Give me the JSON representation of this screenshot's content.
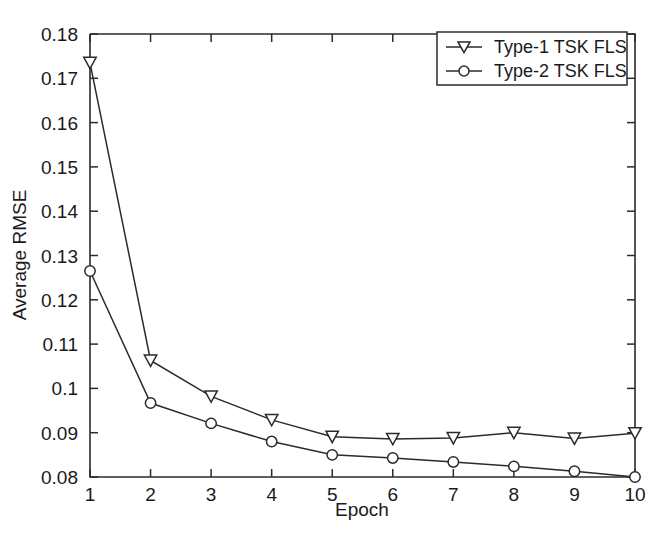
{
  "chart_data": {
    "type": "line",
    "title": "",
    "xlabel": "Epoch",
    "ylabel": "Average RMSE",
    "x": [
      1,
      2,
      3,
      4,
      5,
      6,
      7,
      8,
      9,
      10
    ],
    "xtick_labels": [
      "1",
      "2",
      "3",
      "4",
      "5",
      "6",
      "7",
      "8",
      "9",
      "10"
    ],
    "ytick_labels": [
      "0.08",
      "0.09",
      "0.1",
      "0.11",
      "0.12",
      "0.13",
      "0.14",
      "0.15",
      "0.16",
      "0.17",
      "0.18"
    ],
    "ytick_values": [
      0.08,
      0.09,
      0.1,
      0.11,
      0.12,
      0.13,
      0.14,
      0.15,
      0.16,
      0.17,
      0.18
    ],
    "xlim": [
      1,
      10
    ],
    "ylim": [
      0.08,
      0.18
    ],
    "grid": false,
    "legend_position": "top-right",
    "series": [
      {
        "name": "Type-1 TSK FLS",
        "marker": "triangle-down",
        "color": "#2b2b2b",
        "values": [
          0.1735,
          0.1063,
          0.0982,
          0.0929,
          0.0891,
          0.0886,
          0.0888,
          0.09,
          0.0887,
          0.0899
        ]
      },
      {
        "name": "Type-2 TSK FLS",
        "marker": "circle",
        "color": "#2b2b2b",
        "values": [
          0.1265,
          0.0967,
          0.0921,
          0.088,
          0.085,
          0.0843,
          0.0834,
          0.0824,
          0.0813,
          0.08
        ]
      }
    ]
  },
  "legend": {
    "entries": [
      {
        "label": "Type-1 TSK FLS",
        "marker": "triangle-down-marker-icon"
      },
      {
        "label": "Type-2 TSK FLS",
        "marker": "circle-marker-icon"
      }
    ]
  },
  "axes": {
    "x_title": "Epoch",
    "y_title": "Average RMSE"
  },
  "colors": {
    "line": "#2b2b2b",
    "axis": "#2b2b2b",
    "background": "#ffffff",
    "text": "#1a1a1a"
  }
}
